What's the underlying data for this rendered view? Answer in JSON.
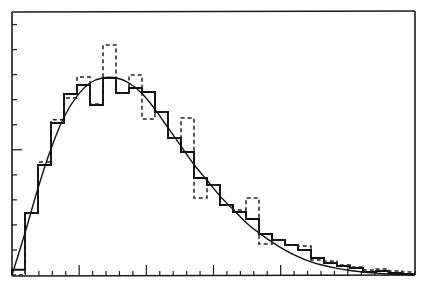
{
  "chart_data": {
    "type": "histogram",
    "title": "",
    "xlabel": "",
    "ylabel": "",
    "x_range": [
      0,
      31
    ],
    "ylim": [
      0,
      1
    ],
    "grid": false,
    "legend": "none",
    "bin_count": 31,
    "series": [
      {
        "name": "histogram-solid",
        "style": "solid-step",
        "values": [
          0.02,
          0.236,
          0.418,
          0.578,
          0.688,
          0.722,
          0.646,
          0.749,
          0.692,
          0.711,
          0.696,
          0.62,
          0.521,
          0.468,
          0.369,
          0.342,
          0.266,
          0.24,
          0.213,
          0.156,
          0.133,
          0.114,
          0.095,
          0.065,
          0.046,
          0.034,
          0.027,
          0.011,
          0.015,
          0.008,
          0.004
        ]
      },
      {
        "name": "histogram-dashed",
        "style": "dashed-step",
        "values": [
          0.0,
          0.236,
          0.43,
          0.59,
          0.673,
          0.753,
          0.65,
          0.875,
          0.692,
          0.76,
          0.593,
          0.62,
          0.521,
          0.597,
          0.293,
          0.342,
          0.266,
          0.247,
          0.293,
          0.118,
          0.133,
          0.114,
          0.11,
          0.057,
          0.053,
          0.038,
          0.03,
          0.019,
          0.023,
          0.015,
          0.011
        ]
      },
      {
        "name": "fitted-curve",
        "style": "smooth-line",
        "x": [
          0,
          1,
          2,
          3,
          4,
          5,
          6,
          7,
          8,
          9,
          10,
          11,
          12,
          13,
          14,
          15,
          16,
          17,
          18,
          19,
          20,
          21,
          22,
          23,
          24,
          25,
          26,
          27,
          28,
          29,
          30,
          31
        ],
        "values": [
          0.0,
          0.16,
          0.33,
          0.48,
          0.6,
          0.68,
          0.73,
          0.75,
          0.75,
          0.73,
          0.69,
          0.63,
          0.56,
          0.49,
          0.42,
          0.36,
          0.3,
          0.25,
          0.2,
          0.16,
          0.125,
          0.095,
          0.07,
          0.05,
          0.036,
          0.025,
          0.017,
          0.011,
          0.007,
          0.004,
          0.002,
          0.001
        ]
      }
    ],
    "y_ticks_count": 10,
    "x_ticks": {
      "minor_count": 30,
      "major_every": 5
    }
  }
}
